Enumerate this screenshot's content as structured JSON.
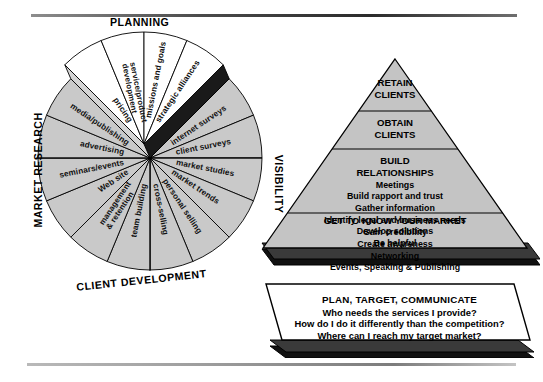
{
  "wheel": {
    "section_labels": [
      {
        "id": "planning",
        "text": "PLANNING"
      },
      {
        "id": "market-research",
        "text": "MARKET RESEARCH"
      },
      {
        "id": "visibility",
        "text": "VISIBILITY"
      },
      {
        "id": "client-development",
        "text": "CLIENT DEVELOPMENT"
      }
    ],
    "segments": [
      {
        "id": "pricing",
        "text": "pricing",
        "group": "planning",
        "raised": true,
        "fill": "#ffffff"
      },
      {
        "id": "service-product-dev",
        "text": "service/product development",
        "group": "planning",
        "raised": true,
        "fill": "#ffffff"
      },
      {
        "id": "missions-and-goals",
        "text": "missions and goals",
        "group": "planning",
        "raised": true,
        "fill": "#ffffff"
      },
      {
        "id": "strategic-alliances",
        "text": "strategic alliances",
        "group": "planning",
        "raised": true,
        "fill": "#ffffff"
      },
      {
        "id": "internet-surveys",
        "text": "internet surveys",
        "group": "market-research",
        "raised": false,
        "fill": "#c9c9c9"
      },
      {
        "id": "client-surveys",
        "text": "client surveys",
        "group": "market-research",
        "raised": false,
        "fill": "#c9c9c9"
      },
      {
        "id": "market-studies",
        "text": "market studies",
        "group": "market-research",
        "raised": false,
        "fill": "#c9c9c9"
      },
      {
        "id": "market-trends",
        "text": "market trends",
        "group": "market-research",
        "raised": false,
        "fill": "#c9c9c9"
      },
      {
        "id": "personal-selling",
        "text": "personal selling",
        "group": "client-development",
        "raised": false,
        "fill": "#c9c9c9"
      },
      {
        "id": "cross-selling",
        "text": "cross-selling",
        "group": "client-development",
        "raised": false,
        "fill": "#c9c9c9"
      },
      {
        "id": "team-building",
        "text": "team building",
        "group": "client-development",
        "raised": false,
        "fill": "#c9c9c9"
      },
      {
        "id": "management-retention",
        "text": "management & retention",
        "group": "client-development",
        "raised": false,
        "fill": "#c9c9c9"
      },
      {
        "id": "web-site",
        "text": "Web site",
        "group": "visibility",
        "raised": false,
        "fill": "#c9c9c9"
      },
      {
        "id": "seminars-events",
        "text": "seminars/events",
        "group": "visibility",
        "raised": false,
        "fill": "#c9c9c9"
      },
      {
        "id": "advertising",
        "text": "advertising",
        "group": "visibility",
        "raised": false,
        "fill": "#c9c9c9"
      },
      {
        "id": "media-publishing",
        "text": "media/publishing",
        "group": "visibility",
        "raised": false,
        "fill": "#c9c9c9"
      }
    ]
  },
  "pyramid": {
    "tiers": [
      {
        "id": "retain-clients",
        "heading_lines": [
          "RETAIN",
          "CLIENTS"
        ],
        "items": []
      },
      {
        "id": "obtain-clients",
        "heading_lines": [
          "OBTAIN",
          "CLIENTS"
        ],
        "items": []
      },
      {
        "id": "build-relationships",
        "heading_lines": [
          "BUILD",
          "RELATIONSHIPS"
        ],
        "items": [
          "Meetings",
          "Build rapport and trust",
          "Gather information",
          "Identify legal and business needs",
          "Develop solutions",
          "Be helpful"
        ]
      },
      {
        "id": "get-to-know-your-market",
        "heading_lines": [
          "GET TO KNOW YOUR MARKET"
        ],
        "items": [
          "Gain credibility",
          "Create awareness",
          "Networking",
          "Events, Speaking & Publishing"
        ]
      }
    ]
  },
  "banner": {
    "id": "plan-target-communicate",
    "title": "PLAN, TARGET, COMMUNICATE",
    "questions": [
      "Who needs the services I provide?",
      "How do I do it differently than the competition?",
      "Where can I reach my target market?"
    ]
  },
  "colors": {
    "segment_fill": "#c9c9c9",
    "raised_fill": "#ffffff",
    "raised_side_dark": "#1a1a1a",
    "raised_side_light": "#d4d4d4",
    "pyramid_fill": "#c4c4c4",
    "pyramid_base_dark": "#111111",
    "banner_fill": "#ffffff",
    "banner_base_dark": "#111111",
    "stroke": "#000000"
  }
}
